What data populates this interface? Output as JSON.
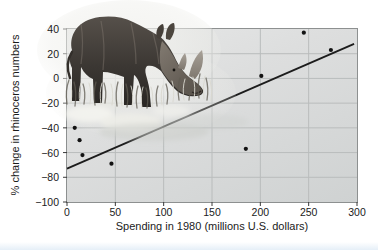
{
  "chart_data": {
    "type": "scatter",
    "xlabel": "Spending in 1980 (millions U.S. dollars)",
    "ylabel": "% change in rhinoceros numbers",
    "xlim": [
      0,
      300
    ],
    "ylim": [
      -100,
      40
    ],
    "xticks": [
      0,
      50,
      100,
      150,
      200,
      250,
      300
    ],
    "yticks": [
      40,
      20,
      0,
      -20,
      -40,
      -60,
      -80,
      -100
    ],
    "grid": true,
    "legend": "none",
    "points": [
      {
        "x": 8,
        "y": -40
      },
      {
        "x": 13,
        "y": -50
      },
      {
        "x": 16,
        "y": -62
      },
      {
        "x": 46,
        "y": -69
      },
      {
        "x": 185,
        "y": -57
      },
      {
        "x": 201,
        "y": 2
      },
      {
        "x": 245,
        "y": 37
      },
      {
        "x": 273,
        "y": 23
      }
    ],
    "trendline": {
      "x1": 0,
      "y1": -73,
      "x2": 297,
      "y2": 28
    },
    "illustration": "black rhinoceros standing in grass with pale reflection",
    "colors": {
      "plot_bg": "#d9dbdb",
      "grid": "#b9bcbc",
      "frame": "#8d9090",
      "tick": "#3a3a3a",
      "line": "#1c1c1c",
      "point": "#121212",
      "text": "#1b1b1b"
    }
  }
}
